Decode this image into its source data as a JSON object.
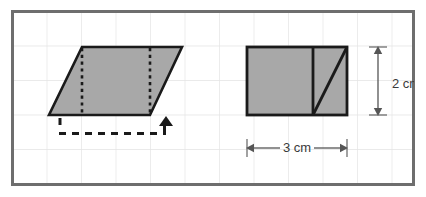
{
  "figure": {
    "panel": {
      "name": "grid-panel",
      "border_color": "#6e6e6e",
      "background_color": "#ffffff",
      "grid_color": "#e4e4e4",
      "x": 12,
      "y": 11,
      "width": 402,
      "height": 174,
      "grid_spacing": 34.5
    },
    "shapes": [
      {
        "name": "parallelogram",
        "fill_color": "#a8a8a8",
        "stroke_color": "#1a1a1a",
        "points": "82,47 182,47 150,115 49,115",
        "interior_dotted_lines": [
          {
            "x1": 82,
            "y1": 47,
            "x2": 82,
            "y2": 115
          },
          {
            "x1": 150,
            "y1": 47,
            "x2": 150,
            "y2": 115
          }
        ]
      },
      {
        "name": "rectangle",
        "fill_color": "#a8a8a8",
        "stroke_color": "#1a1a1a",
        "x": 247,
        "y": 47,
        "width": 100,
        "height": 68,
        "divider_line": {
          "x1": 313,
          "y1": 47,
          "x2": 313,
          "y2": 115
        },
        "diagonal_line": {
          "x1": 313,
          "y1": 115,
          "x2": 347,
          "y2": 47
        }
      }
    ],
    "annotations": {
      "shift_bracket": {
        "name": "dashed-shift-bracket",
        "color": "#1a1a1a",
        "style": "dashed",
        "left_tick": {
          "x": 60,
          "y1": 118,
          "y2": 128
        },
        "horizontal": {
          "x1": 60,
          "y1": 134,
          "x2": 166,
          "y2": 134
        },
        "right_tick": {
          "x": 166,
          "y1": 134,
          "y2": 126
        },
        "arrow_head": {
          "x": 166,
          "y": 118,
          "direction": "up"
        }
      },
      "height_dimension": {
        "name": "height-dimension",
        "label": "2 cm",
        "color": "#555555",
        "orientation": "vertical",
        "line_x": 378,
        "y_start": 47,
        "y_end": 115,
        "label_x": 392,
        "label_y": 85
      },
      "width_dimension": {
        "name": "width-dimension",
        "label": "3 cm",
        "color": "#555555",
        "orientation": "horizontal",
        "line_y": 148,
        "x_start": 247,
        "x_end": 347,
        "label_x": 297,
        "label_y": 152
      }
    }
  }
}
